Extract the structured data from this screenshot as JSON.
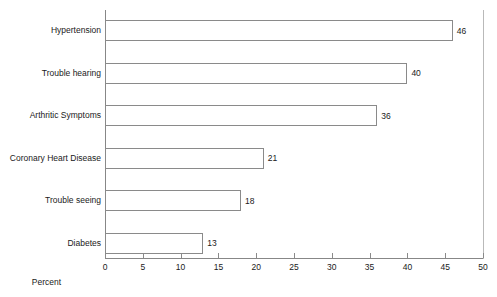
{
  "chart_data": {
    "type": "bar",
    "orientation": "horizontal",
    "title": "",
    "xlabel": "Percent",
    "ylabel": "",
    "xlim": [
      0,
      50
    ],
    "xticks": [
      0,
      5,
      10,
      15,
      20,
      25,
      30,
      35,
      40,
      45,
      50
    ],
    "xtick_labels": [
      "0",
      "5",
      "10",
      "15",
      "20",
      "25",
      "30",
      "35",
      "40",
      "45",
      "50"
    ],
    "grid": false,
    "legend": null,
    "bar_fill_color": "#ffffff",
    "bar_edge_color": "#8a8a8a",
    "axis_color": "#878787",
    "categories": [
      "Hypertension",
      "Trouble hearing",
      "Arthritic Symptoms",
      "Coronary Heart Disease",
      "Trouble seeing",
      "Diabetes"
    ],
    "values": [
      46,
      40,
      36,
      21,
      18,
      13
    ],
    "value_labels": [
      "46",
      "40",
      "36",
      "21",
      "18",
      "13"
    ]
  }
}
